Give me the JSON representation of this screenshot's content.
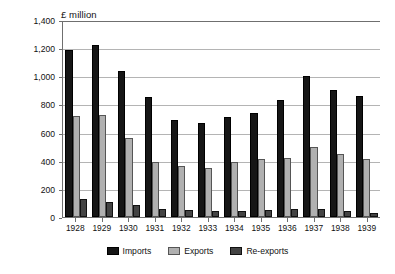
{
  "chart_data": {
    "type": "bar",
    "title": "",
    "subtitle": "",
    "unit_label": "£ million",
    "xlabel": "",
    "ylabel": "£ million",
    "ylim": [
      0,
      1400
    ],
    "ytick_values": [
      0,
      200,
      400,
      600,
      800,
      1000,
      1200,
      1400
    ],
    "ytick_labels": [
      "0",
      "200",
      "400",
      "600",
      "800",
      "1,000",
      "1,200",
      "1,400"
    ],
    "grid": true,
    "legend_position": "bottom-center",
    "categories": [
      "1928",
      "1929",
      "1930",
      "1931",
      "1932",
      "1933",
      "1934",
      "1935",
      "1936",
      "1937",
      "1938",
      "1939"
    ],
    "series": [
      {
        "name": "Imports",
        "color": "#161616",
        "values": [
          1190,
          1220,
          1040,
          855,
          690,
          665,
          710,
          740,
          830,
          1005,
          900,
          860
        ]
      },
      {
        "name": "Exports",
        "color": "#b0b0b0",
        "values": [
          720,
          725,
          560,
          390,
          360,
          350,
          390,
          410,
          420,
          500,
          450,
          410
        ]
      },
      {
        "name": "Re-exports",
        "color": "#434343",
        "values": [
          125,
          110,
          88,
          60,
          50,
          45,
          42,
          48,
          55,
          58,
          45,
          32
        ]
      }
    ]
  }
}
